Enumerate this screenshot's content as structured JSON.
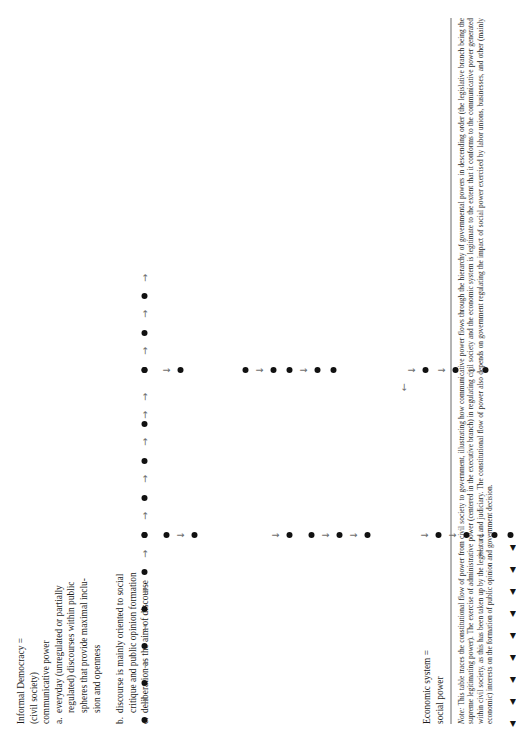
{
  "page": {
    "width": 483,
    "height": 742,
    "rotation_deg": -90,
    "background": "#ffffff",
    "ink": "#111111",
    "arrow_color": "#6e6e6e"
  },
  "labels": {
    "left_column": [
      {
        "id": "informal-democracy-heading",
        "lines": [
          "Informal Democracy =",
          "(civil society)",
          "communicative power"
        ],
        "marker": ""
      },
      {
        "id": "item-a",
        "marker": "a.",
        "lines": [
          "everyday (unregulated or partially",
          "regulated) discourses within public",
          "spheres that provide maximal inclu-",
          "sion and openness"
        ]
      },
      {
        "id": "item-b",
        "marker": "b.",
        "lines": [
          "discourse is mainly oriented to social",
          "critique and public opinion formation"
        ]
      },
      {
        "id": "item-c",
        "marker": "c.",
        "lines": [
          "deliberation as the aim of discourse"
        ]
      }
    ],
    "economic_system": {
      "id": "economic-system",
      "lines": [
        "Economic system =",
        "social power"
      ]
    }
  },
  "note": {
    "label": "Note:",
    "text": " This table traces the constitutional flow of power from civil society to government, illustrating how communicative power flows through the hierarchy of governmental powers in descending order (the legislative branch being the supreme legitimating power). The exercise of administrative power (centered in the executive branch) in regulating civil society and the economic system is legitimate to the extent that it conforms to the communicative power generated within civil society, as this has been taken up by the legislature and judiciary. The constitutional flow of power also depends on government regulating the impact of social power exercised by labor unions, businesses, and other (mainly economic) interests on the formation of public opinion and government decision."
  },
  "chart_data": {
    "type": "diagram",
    "title": "Constitutional flow of power from civil society to government",
    "glyphs": {
      "node": "filled-circle",
      "right_arrow": "→",
      "down_arrow": "↓",
      "left_arrow": "←",
      "left_triangle": "◀"
    },
    "top_chain": {
      "description": "Horizontal chain of nodes joined by right arrows along the top of the table",
      "y": 144,
      "nodes_x": [
        22,
        59,
        96,
        133,
        170,
        207,
        244,
        281,
        318,
        372,
        409,
        446
      ],
      "arrows_x": [
        40,
        77,
        114,
        151,
        188,
        226,
        263,
        300,
        327,
        345,
        391,
        428,
        464
      ]
    },
    "columns": [
      {
        "id": "column-left-branch",
        "x": 207,
        "description": "Vertical branch descending from the top chain through several node groups",
        "items": [
          {
            "type": "node",
            "y": 144
          },
          {
            "type": "node",
            "y": 166
          },
          {
            "type": "down_arrow",
            "y": 180
          },
          {
            "type": "node",
            "y": 194
          },
          {
            "type": "down_arrow",
            "y": 275
          },
          {
            "type": "node",
            "y": 289
          },
          {
            "type": "node",
            "y": 311
          },
          {
            "type": "down_arrow",
            "y": 325
          },
          {
            "type": "node",
            "y": 339
          },
          {
            "type": "down_arrow",
            "y": 353
          },
          {
            "type": "node",
            "y": 367
          },
          {
            "type": "down_arrow",
            "y": 424
          },
          {
            "type": "node",
            "y": 438
          },
          {
            "type": "down_arrow",
            "y": 452
          },
          {
            "type": "node",
            "y": 466
          },
          {
            "type": "down_arrow",
            "y": 480
          },
          {
            "type": "node",
            "y": 494
          },
          {
            "type": "node",
            "y": 510
          }
        ]
      },
      {
        "id": "column-right-branch",
        "x": 372,
        "description": "Second vertical branch descending from the top chain",
        "items": [
          {
            "type": "node",
            "y": 144
          },
          {
            "type": "down_arrow",
            "y": 166
          },
          {
            "type": "node",
            "y": 180
          },
          {
            "type": "node",
            "y": 245
          },
          {
            "type": "down_arrow",
            "y": 259
          },
          {
            "type": "node",
            "y": 273
          },
          {
            "type": "node",
            "y": 289
          },
          {
            "type": "down_arrow",
            "y": 303
          },
          {
            "type": "node",
            "y": 317
          },
          {
            "type": "node",
            "y": 333
          },
          {
            "type": "down_arrow",
            "y": 411
          },
          {
            "type": "node",
            "y": 425
          },
          {
            "type": "down_arrow",
            "y": 441
          },
          {
            "type": "node",
            "y": 455
          },
          {
            "type": "down_arrow",
            "y": 471
          },
          {
            "type": "node",
            "y": 485
          }
        ]
      }
    ],
    "left_arrows": [
      {
        "type": "left_arrow",
        "x": 190,
        "y": 479
      },
      {
        "type": "left_arrow",
        "x": 355,
        "y": 403
      }
    ],
    "left_triangles": {
      "description": "Row of small left-pointing solid triangles running along the bottom edge of the table",
      "y": 512,
      "x_positions": [
        18,
        40,
        62,
        84,
        106,
        128,
        150,
        172,
        194
      ]
    }
  }
}
